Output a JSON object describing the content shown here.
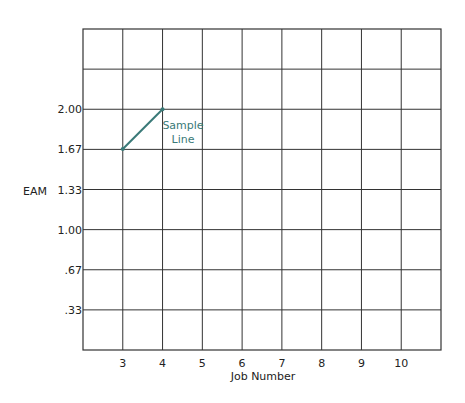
{
  "chart": {
    "ylabel": "EAM",
    "xlabel": "Job Number",
    "y_tick_labels": [
      "2.00",
      "1.67",
      "1.33",
      "1.00",
      ".67",
      ".33"
    ],
    "x_tick_labels": [
      "3",
      "4",
      "5",
      "6",
      "7",
      "8",
      "9",
      "10"
    ],
    "annotation_line1": "Sample",
    "annotation_line2": "Line"
  },
  "colors": {
    "grid": "#333333",
    "series": "#3a7a78",
    "annotation": "#3a7a78"
  },
  "chart_data": {
    "type": "line",
    "title": "",
    "xlabel": "Job Number",
    "ylabel": "EAM",
    "x_ticks": [
      3,
      4,
      5,
      6,
      7,
      8,
      9,
      10
    ],
    "y_ticks": [
      0.33,
      0.67,
      1.0,
      1.33,
      1.67,
      2.0
    ],
    "xlim": [
      2,
      11
    ],
    "ylim": [
      0,
      2.67
    ],
    "grid": true,
    "legend": null,
    "series": [
      {
        "name": "Sample Line",
        "x": [
          3,
          4
        ],
        "y": [
          1.67,
          2.0
        ]
      }
    ],
    "annotations": [
      {
        "text": "Sample Line",
        "x": 4.5,
        "y": 1.85
      }
    ]
  }
}
